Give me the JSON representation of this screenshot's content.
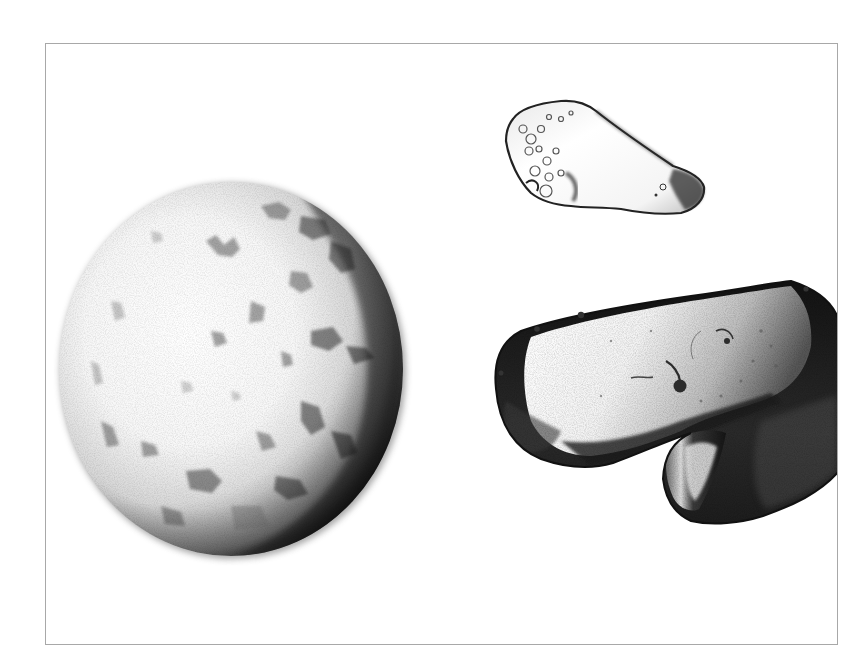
{
  "figure": {
    "description": "Grayscale photograph of three specimens on a white background inside a thin gray frame",
    "background_color": "#ffffff",
    "frame_color": "#a8a8a8",
    "specimens": [
      {
        "id": "sphere",
        "label": "Rounded textured spherical specimen",
        "position": "left"
      },
      {
        "id": "small-fragment",
        "label": "Small translucent fragment",
        "position": "top-right"
      },
      {
        "id": "large-fragment",
        "label": "Large dark angular fragment",
        "position": "bottom-right"
      }
    ]
  }
}
